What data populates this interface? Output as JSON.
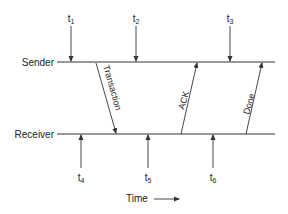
{
  "labels": {
    "sender": "Sender",
    "receiver": "Receiver",
    "time": "Time"
  },
  "sender_times": [
    {
      "base": "t",
      "sub": "1"
    },
    {
      "base": "t",
      "sub": "2"
    },
    {
      "base": "t",
      "sub": "3"
    }
  ],
  "receiver_times": [
    {
      "base": "t",
      "sub": "4"
    },
    {
      "base": "t",
      "sub": "5"
    },
    {
      "base": "t",
      "sub": "6"
    }
  ],
  "messages": [
    {
      "label": "Transaction",
      "direction": "sender-to-receiver"
    },
    {
      "label": "ACK",
      "direction": "receiver-to-sender"
    },
    {
      "label": "Done",
      "direction": "receiver-to-sender"
    }
  ],
  "colors": {
    "line": "#333333",
    "text": "#222222"
  }
}
